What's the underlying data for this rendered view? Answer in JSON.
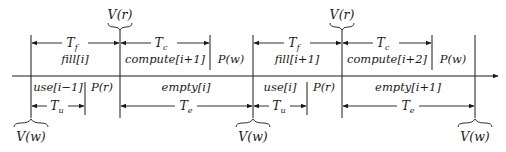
{
  "diagram": {
    "type": "timing-diagram",
    "colors": {
      "ink": "#1a1a1a",
      "background": "#ffffff"
    },
    "axis": {
      "y": 76,
      "x_start": 12,
      "x_end": 500,
      "arrow": "right"
    },
    "top_labels": {
      "v_r_1": "V(r)",
      "v_r_2": "V(r)"
    },
    "bottom_labels": {
      "v_w_1": "V(w)",
      "v_w_2": "V(w)",
      "v_w_3": "V(w)"
    },
    "upper_row": {
      "segments": [
        {
          "label": "fill[i]",
          "interval": "T_f"
        },
        {
          "label": "compute[i+1]",
          "interval": "T_c"
        },
        {
          "label": "P(w)"
        },
        {
          "label": "fill[i+1]",
          "interval": "T_f"
        },
        {
          "label": "compute[i+2]",
          "interval": "T_c"
        },
        {
          "label": "P(w)"
        }
      ]
    },
    "lower_row": {
      "segments": [
        {
          "label": "use[i−1]",
          "interval": "T_u"
        },
        {
          "label": "P(r)"
        },
        {
          "label": "empty[i]",
          "interval": "T_e"
        },
        {
          "label": "use[i]",
          "interval": "T_u"
        },
        {
          "label": "P(r)"
        },
        {
          "label": "empty[i+1]",
          "interval": "T_e"
        }
      ]
    },
    "intervals": {
      "tf": "T",
      "tf_sub": "f",
      "tc": "T",
      "tc_sub": "c",
      "tu": "T",
      "tu_sub": "u",
      "te": "T",
      "te_sub": "e"
    }
  }
}
